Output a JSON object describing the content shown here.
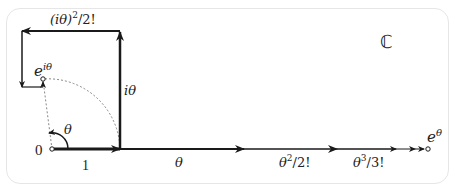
{
  "diagram": {
    "title_symbol": "ℂ",
    "origin_label": "0",
    "unit_label": "1",
    "angle_label": "θ",
    "vectors": {
      "i_theta": "iθ",
      "i_theta_sq": "(iθ)",
      "i_theta_sq_exp": "2",
      "i_theta_sq_div": "/2!",
      "exp_i_theta_base": "e",
      "exp_i_theta_exp": "iθ",
      "theta": "θ",
      "theta_sq": "θ",
      "theta_sq_exp": "2",
      "theta_sq_div": "/2!",
      "theta_cu": "θ",
      "theta_cu_exp": "3",
      "theta_cu_div": "/3!",
      "exp_theta_base": "e",
      "exp_theta_exp": "θ"
    },
    "colors": {
      "stroke": "#1a1a1a",
      "dotted": "#888888",
      "frame": "#e6e6e6"
    }
  }
}
